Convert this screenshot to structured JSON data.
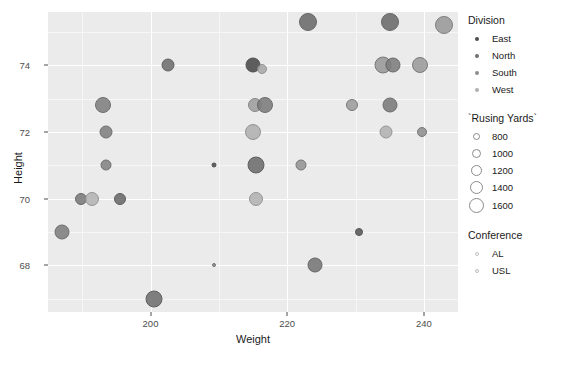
{
  "chart_data": {
    "type": "scatter",
    "title": "",
    "xlabel": "Weight",
    "ylabel": "Height",
    "xlim": [
      185,
      245
    ],
    "ylim": [
      66.6,
      75.6
    ],
    "x_ticks": [
      200,
      220,
      240
    ],
    "y_ticks": [
      68,
      70,
      72,
      74
    ],
    "grid": true,
    "panel_background": "#ebebeb",
    "grid_color": "#ffffff",
    "size_variable": "`Rusing Yards`",
    "color_variable": "Division",
    "shape_variable": "Conference",
    "points": [
      {
        "x": 223.0,
        "y": 75.3,
        "rushing_yards": 1450,
        "division": "North",
        "conference": "AL",
        "color": "#6b6b6b",
        "r": 9.0,
        "stroke": "#555555"
      },
      {
        "x": 235.0,
        "y": 75.3,
        "rushing_yards": 1450,
        "division": "North",
        "conference": "AL",
        "color": "#6b6b6b",
        "r": 9.0,
        "stroke": "#555555"
      },
      {
        "x": 243.0,
        "y": 75.2,
        "rushing_yards": 1500,
        "division": "South",
        "conference": "USL",
        "color": "#9a9a9a",
        "r": 9.0,
        "stroke": "#6f6f6f"
      },
      {
        "x": 202.5,
        "y": 74.0,
        "rushing_yards": 900,
        "division": "East",
        "conference": "AL",
        "color": "#6e6e6e",
        "r": 6.5,
        "stroke": "#4f4f4f"
      },
      {
        "x": 215.0,
        "y": 74.0,
        "rushing_yards": 1050,
        "division": "East",
        "conference": "AL",
        "color": "#4a4a4a",
        "r": 7.5,
        "stroke": "#3a3a3a"
      },
      {
        "x": 216.3,
        "y": 73.9,
        "rushing_yards": 700,
        "division": "West",
        "conference": "USL",
        "color": "#a8a8a8",
        "r": 5.0,
        "stroke": "#8a8a8a"
      },
      {
        "x": 234.0,
        "y": 74.0,
        "rushing_yards": 1300,
        "division": "South",
        "conference": "USL",
        "color": "#999999",
        "r": 8.5,
        "stroke": "#6a6a6a"
      },
      {
        "x": 235.5,
        "y": 74.0,
        "rushing_yards": 1150,
        "division": "North",
        "conference": "AL",
        "color": "#7d7d7d",
        "r": 7.5,
        "stroke": "#5a5a5a"
      },
      {
        "x": 239.5,
        "y": 74.0,
        "rushing_yards": 1250,
        "division": "South",
        "conference": "USL",
        "color": "#9b9b9b",
        "r": 8.0,
        "stroke": "#6c6c6c"
      },
      {
        "x": 193.0,
        "y": 72.8,
        "rushing_yards": 1150,
        "division": "North",
        "conference": "AL",
        "color": "#808080",
        "r": 8.0,
        "stroke": "#5e5e5e"
      },
      {
        "x": 215.3,
        "y": 72.8,
        "rushing_yards": 1000,
        "division": "West",
        "conference": "USL",
        "color": "#9e9e9e",
        "r": 7.0,
        "stroke": "#7a7a7a"
      },
      {
        "x": 216.8,
        "y": 72.8,
        "rushing_yards": 1150,
        "division": "North",
        "conference": "AL",
        "color": "#7c7c7c",
        "r": 8.0,
        "stroke": "#5c5c5c"
      },
      {
        "x": 229.5,
        "y": 72.8,
        "rushing_yards": 800,
        "division": "South",
        "conference": "USL",
        "color": "#9d9d9d",
        "r": 6.0,
        "stroke": "#6a6a6a"
      },
      {
        "x": 235.0,
        "y": 72.8,
        "rushing_yards": 1100,
        "division": "North",
        "conference": "AL",
        "color": "#7b7b7b",
        "r": 7.5,
        "stroke": "#5b5b5b"
      },
      {
        "x": 193.5,
        "y": 72.0,
        "rushing_yards": 850,
        "division": "North",
        "conference": "AL",
        "color": "#808080",
        "r": 6.5,
        "stroke": "#5e5e5e"
      },
      {
        "x": 215.0,
        "y": 72.0,
        "rushing_yards": 1100,
        "division": "West",
        "conference": "USL",
        "color": "#b0b0b0",
        "r": 8.0,
        "stroke": "#878787"
      },
      {
        "x": 234.5,
        "y": 72.0,
        "rushing_yards": 900,
        "division": "West",
        "conference": "USL",
        "color": "#b2b2b2",
        "r": 6.5,
        "stroke": "#8a8a8a"
      },
      {
        "x": 239.8,
        "y": 72.0,
        "rushing_yards": 700,
        "division": "South",
        "conference": "USL",
        "color": "#8f8f8f",
        "r": 5.0,
        "stroke": "#666666"
      },
      {
        "x": 193.5,
        "y": 71.0,
        "rushing_yards": 800,
        "division": "North",
        "conference": "AL",
        "color": "#848484",
        "r": 5.5,
        "stroke": "#616161"
      },
      {
        "x": 209.3,
        "y": 71.0,
        "rushing_yards": 400,
        "division": "East",
        "conference": "AL",
        "color": "#4f4f4f",
        "r": 2.5,
        "stroke": "#3c3c3c"
      },
      {
        "x": 215.5,
        "y": 71.0,
        "rushing_yards": 1250,
        "division": "North",
        "conference": "AL",
        "color": "#6d6d6d",
        "r": 8.5,
        "stroke": "#4d4d4d"
      },
      {
        "x": 222.0,
        "y": 71.0,
        "rushing_yards": 800,
        "division": "South",
        "conference": "USL",
        "color": "#959595",
        "r": 5.5,
        "stroke": "#676767"
      },
      {
        "x": 189.8,
        "y": 70.0,
        "rushing_yards": 800,
        "division": "North",
        "conference": "AL",
        "color": "#7a7a7a",
        "r": 6.0,
        "stroke": "#585858"
      },
      {
        "x": 191.5,
        "y": 70.0,
        "rushing_yards": 950,
        "division": "West",
        "conference": "USL",
        "color": "#b4b4b4",
        "r": 7.0,
        "stroke": "#8b8b8b"
      },
      {
        "x": 195.5,
        "y": 70.0,
        "rushing_yards": 800,
        "division": "East",
        "conference": "AL",
        "color": "#6a6a6a",
        "r": 6.0,
        "stroke": "#4a4a4a"
      },
      {
        "x": 215.5,
        "y": 70.0,
        "rushing_yards": 950,
        "division": "West",
        "conference": "USL",
        "color": "#b3b3b3",
        "r": 7.0,
        "stroke": "#8b8b8b"
      },
      {
        "x": 187.0,
        "y": 69.0,
        "rushing_yards": 1000,
        "division": "North",
        "conference": "AL",
        "color": "#7e7e7e",
        "r": 7.5,
        "stroke": "#5c5c5c"
      },
      {
        "x": 230.5,
        "y": 69.0,
        "rushing_yards": 550,
        "division": "East",
        "conference": "AL",
        "color": "#585858",
        "r": 4.0,
        "stroke": "#414141"
      },
      {
        "x": 209.3,
        "y": 68.0,
        "rushing_yards": 300,
        "division": "South",
        "conference": "USL",
        "color": "#8d8d8d",
        "r": 2.0,
        "stroke": "#616161"
      },
      {
        "x": 224.0,
        "y": 68.0,
        "rushing_yards": 1000,
        "division": "North",
        "conference": "AL",
        "color": "#767676",
        "r": 7.5,
        "stroke": "#545454"
      },
      {
        "x": 200.5,
        "y": 67.0,
        "rushing_yards": 1200,
        "division": "North",
        "conference": "AL",
        "color": "#6f6f6f",
        "r": 8.5,
        "stroke": "#4e4e4e"
      }
    ]
  },
  "axes": {
    "x_title": "Weight",
    "y_title": "Height",
    "x_tick_labels": [
      "200",
      "220",
      "240"
    ],
    "y_tick_labels": [
      "68",
      "70",
      "72",
      "74"
    ]
  },
  "legends": {
    "division": {
      "title": "Division",
      "items": [
        {
          "label": "East",
          "color": "#4f4f4f"
        },
        {
          "label": "North",
          "color": "#6e6e6e"
        },
        {
          "label": "South",
          "color": "#8d8d8d"
        },
        {
          "label": "West",
          "color": "#b0b0b0"
        }
      ]
    },
    "size": {
      "title": "`Rusing Yards`",
      "items": [
        {
          "label": "800",
          "size": 7
        },
        {
          "label": "1000",
          "size": 9
        },
        {
          "label": "1200",
          "size": 11
        },
        {
          "label": "1400",
          "size": 13
        },
        {
          "label": "1600",
          "size": 15
        }
      ]
    },
    "conference": {
      "title": "Conference",
      "items": [
        {
          "label": "AL",
          "color": "#c0c0c0"
        },
        {
          "label": "USL",
          "color": "#bcbcbc"
        }
      ]
    }
  }
}
